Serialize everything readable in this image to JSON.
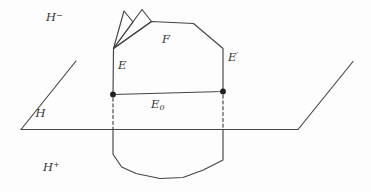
{
  "figure": {
    "background": "#fdfdfd",
    "stroke_color": "#454545",
    "dot_color": "#1f1f1f",
    "text_color": "#333333",
    "labels": {
      "h_minus": {
        "base": "H",
        "sup": "−"
      },
      "h_plus": {
        "base": "H",
        "sup": "+"
      },
      "h": "H",
      "f": "F",
      "e": "E",
      "e_prime": {
        "base": "E",
        "sup": "′"
      },
      "e_zero": {
        "base": "E",
        "sub": "0"
      }
    },
    "shapes": {
      "plane_bottom_edge": "21,129.5 298,129.5",
      "plane_left_edge": "21,129.5 76,61",
      "plane_right_edge": "298,129.5 353,61.5",
      "upper_face": "113,94.5 113.5,48.5 151.5,21.5 193.5,23.5 223,48.5 223,91.5",
      "spike_left": "113.5,48.5 124,11 133,22",
      "spike_right": "113.5,48.5 142,9.5 151.5,21.5",
      "lower_part": "113,129.5 113,154.3 121.7,167 136,173.5 160,178.5 183,177.5 203.3,170 223,160 223,129.5",
      "dashed_left": "113,98 113,129",
      "dashed_right": "223,95 223,129",
      "vertex_left": {
        "cx": "113",
        "cy": "94.5",
        "r": "2.9"
      },
      "vertex_right": {
        "cx": "223",
        "cy": "91.5",
        "r": "2.9"
      }
    }
  }
}
